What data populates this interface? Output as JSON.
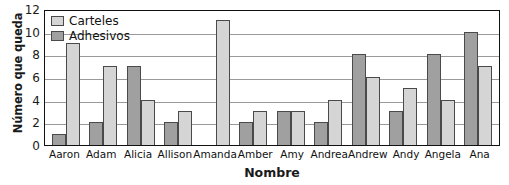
{
  "chart_data": {
    "type": "bar",
    "title": "",
    "xlabel": "Nombre",
    "ylabel": "Número que queda",
    "ylim": [
      0,
      12
    ],
    "yticks": [
      12,
      10,
      8,
      6,
      4,
      2,
      0
    ],
    "grid": true,
    "legend_position": "top-left-inside",
    "bar_order_in_group": [
      "Adhesivos",
      "Carteles"
    ],
    "categories": [
      "Aaron",
      "Adam",
      "Alicia",
      "Allison",
      "Amanda",
      "Amber",
      "Amy",
      "Andrea",
      "Andrew",
      "Andy",
      "Angela",
      "Ana"
    ],
    "series": [
      {
        "name": "Adhesivos",
        "color": "#a0a0a0",
        "values": [
          1,
          2,
          7,
          2,
          0,
          2,
          3,
          2,
          8,
          3,
          8,
          10
        ]
      },
      {
        "name": "Carteles",
        "color": "#d5d5d5",
        "values": [
          9,
          7,
          4,
          3,
          11,
          3,
          3,
          4,
          6,
          5,
          4,
          7
        ]
      }
    ]
  },
  "legend": {
    "items": [
      {
        "label": "Carteles",
        "swatch": "light"
      },
      {
        "label": "Adhesivos",
        "swatch": "dark"
      }
    ]
  },
  "colors": {
    "carteles": "#d5d5d5",
    "adhesivos": "#a0a0a0",
    "axis": "#111111",
    "gridline": "#9a9a9a",
    "background": "#ffffff"
  }
}
